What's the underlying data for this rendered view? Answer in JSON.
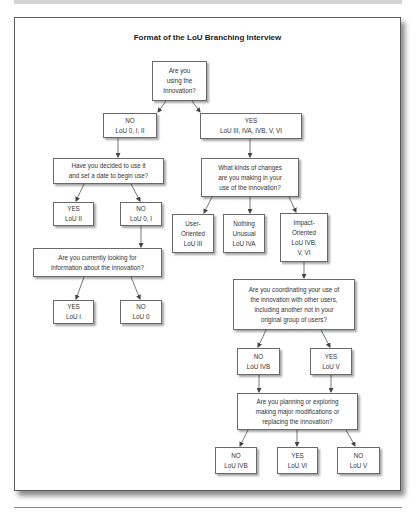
{
  "title": "Format of the LoU Branching Interview",
  "nodes": {
    "q_using": {
      "lines": [
        "Are you",
        "using the",
        "Innovation?"
      ]
    },
    "no_using": {
      "lines": [
        "NO",
        "LoU 0, I, II"
      ]
    },
    "yes_using": {
      "lines": [
        "YES",
        "LoU III, IVA, IVB, V, VI"
      ]
    },
    "q_decided": {
      "lines": [
        "Have you decided to use it",
        "and set a date to begin use?"
      ]
    },
    "q_changes": {
      "lines": [
        "What kinds of changes",
        "are you making in your",
        "use of the innovation?"
      ]
    },
    "yes_decided": {
      "lines": [
        "YES",
        "LoU II"
      ]
    },
    "no_decided": {
      "lines": [
        "NO",
        "LoU 0, I"
      ]
    },
    "user_oriented": {
      "lines": [
        "User-",
        "Oriented",
        "LoU III"
      ]
    },
    "nothing_unusual": {
      "lines": [
        "Nothing",
        "Unusual",
        "LoU IVA"
      ]
    },
    "impact_oriented": {
      "lines": [
        "Impact-",
        "Oriented",
        "LoU IVB,",
        "V, VI"
      ]
    },
    "q_looking": {
      "lines": [
        "Are you currently looking for",
        "information about the innovation?"
      ]
    },
    "yes_looking": {
      "lines": [
        "YES",
        "LoU I"
      ]
    },
    "no_looking": {
      "lines": [
        "NO",
        "LoU 0"
      ]
    },
    "q_coordinating": {
      "lines": [
        "Are you coordinating your use of",
        "the innovation with other users,",
        "including another not in your",
        "original group of users?"
      ]
    },
    "no_coordinating": {
      "lines": [
        "NO",
        "LoU IVB"
      ]
    },
    "yes_coordinating": {
      "lines": [
        "YES",
        "LoU V"
      ]
    },
    "q_planning": {
      "lines": [
        "Are you planning or exploring",
        "making major modifications or",
        "replacing the innovation?"
      ]
    },
    "no_planning_ivb": {
      "lines": [
        "NO",
        "LoU IVB"
      ]
    },
    "yes_planning": {
      "lines": [
        "YES",
        "LoU VI"
      ]
    },
    "no_planning_v": {
      "lines": [
        "NO",
        "LoU V"
      ]
    }
  }
}
